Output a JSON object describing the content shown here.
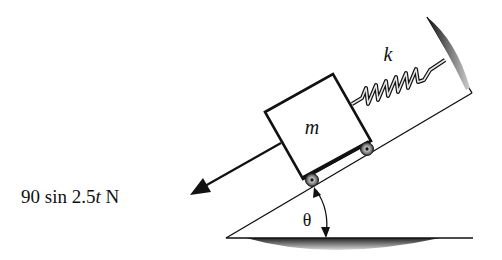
{
  "figure": {
    "type": "mechanics-diagram"
  },
  "labels": {
    "mass": "m",
    "spring": "k",
    "angle": "θ",
    "force_prefix": "90 sin 2.5",
    "force_var": "t",
    "force_unit": " N"
  },
  "elements": {
    "incline_angle_symbol": "θ",
    "force_amplitude": 90,
    "force_frequency": 2.5,
    "force_units": "N"
  },
  "colors": {
    "ink": "#111111",
    "background": "#ffffff",
    "shade_dark": "#222222",
    "shade_light": "#d8d8d8"
  }
}
